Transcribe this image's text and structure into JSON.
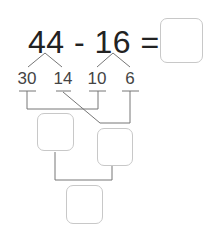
{
  "equation": {
    "left": "44",
    "operator": "-",
    "right": "16",
    "equals": "="
  },
  "decomposition": {
    "left_parts": [
      "30",
      "14"
    ],
    "right_parts": [
      "10",
      "6"
    ]
  },
  "colors": {
    "text": "#222222",
    "line": "#777777",
    "box_border": "#c8c8c8"
  },
  "boxes": {
    "answer": "",
    "tens_sum": "",
    "ones_diff": "",
    "final": ""
  }
}
